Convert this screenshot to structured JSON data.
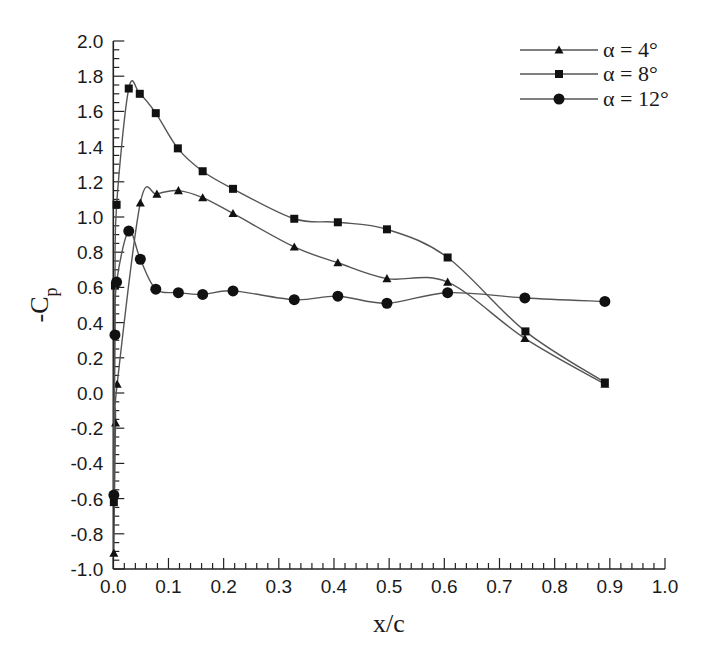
{
  "chart_data": {
    "type": "line",
    "title": "",
    "xlabel": "x/c",
    "ylabel": "-C",
    "ylabel_subscript": "p",
    "xlim": [
      0.0,
      1.0
    ],
    "ylim": [
      -1.0,
      2.0
    ],
    "x_ticks": [
      "0.0",
      "0.1",
      "0.2",
      "0.3",
      "0.4",
      "0.5",
      "0.6",
      "0.7",
      "0.8",
      "0.9",
      "1.0"
    ],
    "y_ticks": [
      "2.0",
      "1.8",
      "1.6",
      "1.4",
      "1.2",
      "1.0",
      "0.8",
      "0.6",
      "0.4",
      "0.2",
      "0.0",
      "-0.2",
      "-0.4",
      "-0.6",
      "-0.8",
      "-1.0"
    ],
    "grid": false,
    "legend_position": "top-right",
    "series": [
      {
        "name": "α = 4°",
        "marker": "triangle",
        "x": [
          0.001,
          0.004,
          0.007,
          0.049,
          0.079,
          0.118,
          0.162,
          0.217,
          0.328,
          0.407,
          0.496,
          0.606,
          0.746,
          0.891
        ],
        "values": [
          -0.91,
          -0.17,
          0.05,
          1.08,
          1.13,
          1.15,
          1.11,
          1.02,
          0.83,
          0.74,
          0.65,
          0.63,
          0.31,
          0.05
        ]
      },
      {
        "name": "α = 8°",
        "marker": "square",
        "x": [
          0.001,
          0.003,
          0.006,
          0.028,
          0.048,
          0.077,
          0.117,
          0.162,
          0.217,
          0.328,
          0.407,
          0.496,
          0.606,
          0.747,
          0.891
        ],
        "values": [
          -0.62,
          0.61,
          1.07,
          1.73,
          1.7,
          1.59,
          1.39,
          1.26,
          1.16,
          0.99,
          0.97,
          0.93,
          0.77,
          0.35,
          0.06
        ]
      },
      {
        "name": "α = 12°",
        "marker": "circle",
        "x": [
          0.001,
          0.003,
          0.006,
          0.028,
          0.049,
          0.077,
          0.118,
          0.162,
          0.217,
          0.328,
          0.407,
          0.496,
          0.606,
          0.746,
          0.891
        ],
        "values": [
          -0.58,
          0.33,
          0.63,
          0.92,
          0.76,
          0.59,
          0.57,
          0.56,
          0.58,
          0.53,
          0.55,
          0.51,
          0.57,
          0.54,
          0.52
        ]
      }
    ]
  },
  "colors": {
    "line": "#555555",
    "marker": "#111111",
    "axis": "#222222",
    "background": "#ffffff"
  }
}
